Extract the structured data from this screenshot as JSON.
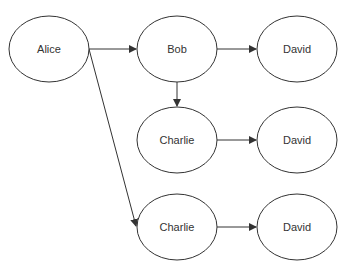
{
  "diagram": {
    "type": "flow",
    "nodes": [
      {
        "id": "alice",
        "label": "Alice",
        "cx": 49,
        "cy": 49,
        "rx": 40,
        "ry": 33
      },
      {
        "id": "bob",
        "label": "Bob",
        "cx": 177,
        "cy": 49,
        "rx": 40,
        "ry": 33
      },
      {
        "id": "david1",
        "label": "David",
        "cx": 297,
        "cy": 49,
        "rx": 40,
        "ry": 33
      },
      {
        "id": "charlie1",
        "label": "Charlie",
        "cx": 177,
        "cy": 140,
        "rx": 40,
        "ry": 33
      },
      {
        "id": "david2",
        "label": "David",
        "cx": 297,
        "cy": 140,
        "rx": 40,
        "ry": 33
      },
      {
        "id": "charlie2",
        "label": "Charlie",
        "cx": 177,
        "cy": 227,
        "rx": 40,
        "ry": 33
      },
      {
        "id": "david3",
        "label": "David",
        "cx": 297,
        "cy": 227,
        "rx": 40,
        "ry": 33
      }
    ],
    "edges": [
      {
        "from": "alice",
        "to": "bob",
        "x1": 89,
        "y1": 49,
        "x2": 136,
        "y2": 49
      },
      {
        "from": "bob",
        "to": "david1",
        "x1": 217,
        "y1": 49,
        "x2": 256,
        "y2": 49
      },
      {
        "from": "bob",
        "to": "charlie1",
        "x1": 177,
        "y1": 82,
        "x2": 177,
        "y2": 106
      },
      {
        "from": "charlie1",
        "to": "david2",
        "x1": 217,
        "y1": 140,
        "x2": 256,
        "y2": 140
      },
      {
        "from": "alice",
        "to": "charlie2",
        "x1": 89,
        "y1": 49,
        "x2": 136,
        "y2": 226
      },
      {
        "from": "charlie2",
        "to": "david3",
        "x1": 217,
        "y1": 227,
        "x2": 256,
        "y2": 227
      }
    ],
    "colors": {
      "stroke": "#333333",
      "fill": "#ffffff",
      "text": "#333333"
    }
  }
}
